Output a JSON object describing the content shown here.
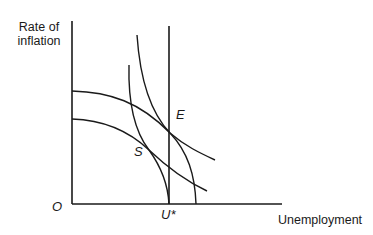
{
  "diagram": {
    "type": "phillips-curve-diagram",
    "y_axis_label_line1": "Rate of",
    "y_axis_label_line2": "inflation",
    "x_axis_label": "Unemployment",
    "origin_label": "O",
    "natural_rate_label": "U*",
    "point_e_label": "E",
    "point_s_label": "S",
    "stroke_color": "#1a1a1a",
    "background_color": "#ffffff",
    "elements": [
      {
        "name": "long-run-vertical-line",
        "at_label": "U*"
      },
      {
        "name": "upper-flat-curve",
        "passes_through": "E"
      },
      {
        "name": "lower-flat-curve",
        "passes_through": "S"
      },
      {
        "name": "outer-steep-curve",
        "passes_through": "E"
      },
      {
        "name": "inner-steep-curve",
        "passes_through": "S"
      }
    ]
  }
}
